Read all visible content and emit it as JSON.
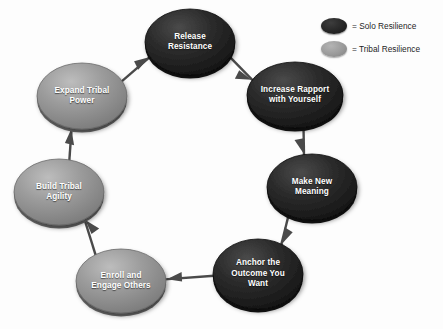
{
  "diagram": {
    "background_color": "#fdfdfd",
    "solo_color": "#262626",
    "tribal_color": "#9a9a9a",
    "connector_color": "#4a4a4a",
    "label_color": "#ffffff",
    "flow_direction": "clockwise",
    "nodes": [
      {
        "id": "release-resistance",
        "label": "Release\nResistance",
        "type": "Solo Resilience",
        "cx": 190,
        "cy": 42,
        "rx": 45,
        "ry": 33
      },
      {
        "id": "increase-rapport-with-yourself",
        "label": "Increase Rapport\nwith Yourself",
        "type": "Solo Resilience",
        "cx": 295,
        "cy": 95,
        "rx": 48,
        "ry": 33
      },
      {
        "id": "make-new-meaning",
        "label": "Make New\nMeaning",
        "type": "Solo Resilience",
        "cx": 312,
        "cy": 187,
        "rx": 45,
        "ry": 33
      },
      {
        "id": "anchor-the-outcome-you-want",
        "label": "Anchor the\nOutcome You\nWant",
        "type": "Solo Resilience",
        "cx": 258,
        "cy": 274,
        "rx": 45,
        "ry": 35
      },
      {
        "id": "enroll-and-engage-others",
        "label": "Enroll and\nEngage Others",
        "type": "Tribal Resilience",
        "cx": 121,
        "cy": 281,
        "rx": 45,
        "ry": 32
      },
      {
        "id": "build-tribal-agility",
        "label": "Build Tribal\nAgility",
        "type": "Tribal Resilience",
        "cx": 59,
        "cy": 192,
        "rx": 45,
        "ry": 33
      },
      {
        "id": "expand-tribal-power",
        "label": "Expand Tribal\nPower",
        "type": "Tribal Resilience",
        "cx": 82,
        "cy": 96,
        "rx": 45,
        "ry": 33
      }
    ],
    "connectors": [
      {
        "id": "release-to-increase",
        "from": "release-resistance",
        "to": "increase-rapport-with-yourself"
      },
      {
        "id": "increase-to-make-new",
        "from": "increase-rapport-with-yourself",
        "to": "make-new-meaning"
      },
      {
        "id": "make-new-to-anchor",
        "from": "make-new-meaning",
        "to": "anchor-the-outcome-you-want"
      },
      {
        "id": "anchor-to-enroll",
        "from": "anchor-the-outcome-you-want",
        "to": "enroll-and-engage-others"
      },
      {
        "id": "enroll-to-build",
        "from": "enroll-and-engage-others",
        "to": "build-tribal-agility"
      },
      {
        "id": "build-to-expand",
        "from": "build-tribal-agility",
        "to": "expand-tribal-power"
      },
      {
        "id": "expand-to-release",
        "from": "expand-tribal-power",
        "to": "release-resistance"
      }
    ]
  },
  "legend": {
    "items": [
      {
        "id": "solo",
        "swatch_color": "#262626",
        "text": "= Solo Resilience"
      },
      {
        "id": "tribal",
        "swatch_color": "#9a9a9a",
        "text": "= Tribal Resilience"
      }
    ]
  }
}
